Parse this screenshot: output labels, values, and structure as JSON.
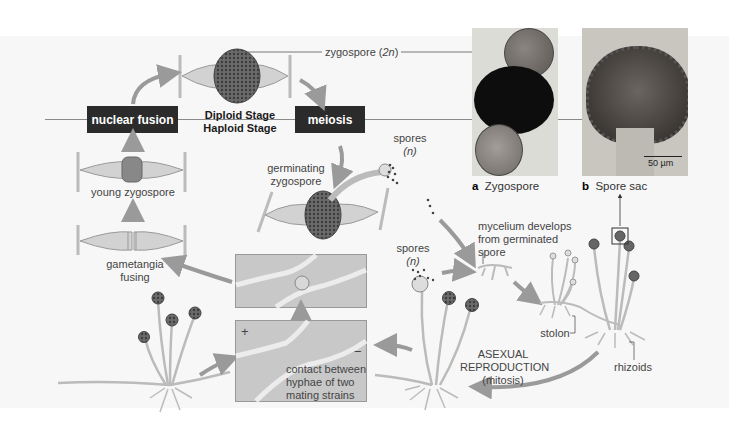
{
  "stages": {
    "nuclear_fusion": "nuclear fusion",
    "meiosis": "meiosis",
    "diploid": "Diploid Stage",
    "haploid": "Haploid Stage"
  },
  "labels": {
    "zygospore_2n": "zygospore (2n)",
    "zygospore_2n_prefix": "zygospore (",
    "zygospore_2n_n": "2n",
    "zygospore_2n_suffix": ")",
    "young_zygospore": "young zygospore",
    "gametangia_line1": "gametangia",
    "gametangia_line2": "fusing",
    "germinating_line1": "germinating",
    "germinating_line2": "zygospore",
    "spores_top": "spores",
    "spores_top_n": "(n)",
    "spores_mid": "spores",
    "spores_mid_n": "(n)",
    "mycelium_line1": "mycelium develops",
    "mycelium_line2": "from germinated",
    "mycelium_line3": "spore",
    "contact_line1": "contact between",
    "contact_line2": "hyphae of two",
    "contact_line3": "mating strains",
    "plus": "+",
    "minus": "−",
    "asexual_line1": "ASEXUAL",
    "asexual_line2": "REPRODUCTION",
    "asexual_line3": "(mitosis)",
    "stolon": "stolon",
    "rhizoids": "rhizoids"
  },
  "photos": {
    "a": {
      "letter": "a",
      "caption": "Zygospore"
    },
    "b": {
      "letter": "b",
      "caption": "Spore sac",
      "scale_bar": "50 µm"
    }
  },
  "colors": {
    "background": "#f7f7f7",
    "stage_box": "#2b2b2b",
    "arrow": "#9a9a9a",
    "inset": "#c8c8c8",
    "hypha": "#d9d9d9",
    "zygospore": "#5a5a5a"
  }
}
